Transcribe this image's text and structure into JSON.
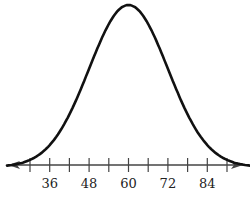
{
  "chart_data": {
    "type": "line",
    "title": "",
    "xlabel": "",
    "ylabel": "",
    "mean": 60,
    "std_dev": 12,
    "xlim": [
      30,
      90
    ],
    "x_ticks": [
      30,
      36,
      42,
      48,
      54,
      60,
      66,
      72,
      78,
      84,
      90
    ],
    "x_tick_labels": [
      "36",
      "48",
      "60",
      "72",
      "84"
    ],
    "x_tick_label_values": [
      36,
      48,
      60,
      72,
      84
    ],
    "y_axis_shown": false,
    "grid": false,
    "legend": null,
    "axis_arrows": "both ends",
    "stroke_color": "#111111"
  }
}
